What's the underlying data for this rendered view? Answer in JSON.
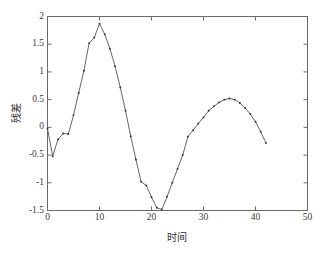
{
  "chart_data": {
    "type": "line",
    "title": "",
    "xlabel": "时间",
    "ylabel": "残差",
    "xlim": [
      0,
      50
    ],
    "ylim": [
      -1.5,
      2
    ],
    "xticks": [
      0,
      10,
      20,
      30,
      40,
      50
    ],
    "xtick_labels": [
      "0",
      "10",
      "20",
      "30",
      "40",
      "50"
    ],
    "yticks": [
      -1.5,
      -1,
      -0.5,
      0,
      0.5,
      1,
      1.5,
      2
    ],
    "ytick_labels": [
      "-1.5",
      "-1",
      "-0.5",
      "0",
      "0.5",
      "1",
      "1.5",
      "2"
    ],
    "grid": false,
    "legend": null,
    "marker": "dot",
    "line_color": "#555555",
    "marker_color": "#333333",
    "axis_color": "#6a6a6a",
    "background_color": "#ffffff",
    "series": [
      {
        "name": "残差",
        "x": [
          0,
          1,
          2,
          3,
          4,
          5,
          6,
          7,
          8,
          9,
          10,
          11,
          12,
          13,
          14,
          15,
          16,
          17,
          18,
          19,
          20,
          21,
          22,
          23,
          24,
          25,
          26,
          27,
          28,
          29,
          30,
          31,
          32,
          33,
          34,
          35,
          36,
          37,
          38,
          39,
          40,
          41,
          42
        ],
        "y": [
          -0.02,
          -0.52,
          -0.22,
          -0.11,
          -0.12,
          0.22,
          0.62,
          1.02,
          1.52,
          1.62,
          1.87,
          1.68,
          1.42,
          1.1,
          0.72,
          0.3,
          -0.16,
          -0.58,
          -0.98,
          -1.05,
          -1.26,
          -1.45,
          -1.48,
          -1.25,
          -1.0,
          -0.75,
          -0.5,
          -0.17,
          -0.05,
          0.07,
          0.18,
          0.3,
          0.38,
          0.45,
          0.5,
          0.52,
          0.5,
          0.44,
          0.35,
          0.24,
          0.1,
          -0.08,
          -0.28
        ]
      }
    ]
  },
  "axes": {
    "xlabel": "时间",
    "ylabel": "残差"
  }
}
